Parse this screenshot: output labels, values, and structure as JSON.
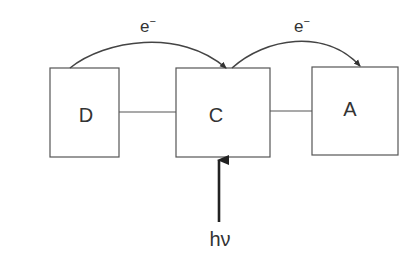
{
  "diagram": {
    "nodes": [
      {
        "id": "D",
        "label": "D"
      },
      {
        "id": "C",
        "label": "C"
      },
      {
        "id": "A",
        "label": "A"
      }
    ],
    "transfers": [
      {
        "from": "D",
        "to": "C",
        "label": "e",
        "superscript": "−"
      },
      {
        "from": "C",
        "to": "A",
        "label": "e",
        "superscript": "−"
      }
    ],
    "excitation": {
      "target": "C",
      "label": "hν"
    },
    "colors": {
      "stroke": "#555555",
      "text": "#333333",
      "background": "#ffffff"
    }
  }
}
